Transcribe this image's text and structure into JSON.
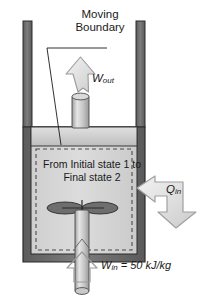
{
  "figure": {
    "type": "thermodynamics-schematic"
  },
  "labels": {
    "moving_boundary": "Moving Boundary",
    "work_out_symbol": "W",
    "work_out_subscript": "out",
    "heat_in_symbol": "Q",
    "heat_in_subscript": "in",
    "work_in_symbol": "W",
    "work_in_subscript": "in",
    "work_in_value": " = 50 kJ/kg",
    "process_state": "From Initial state 1 to Final state 2"
  },
  "colors": {
    "wall_dark": "#6b6b6b",
    "wall_outline": "#2b2b2b",
    "gas_fill": "#d8d8d8",
    "piston_fill": "#cfcfcf",
    "arrow_fill": "#e4e4e4",
    "arrow_stroke": "#8a8a8a",
    "shaft_fill": "#c4c4c4",
    "text": "#1a1a1a",
    "background": "#ffffff"
  }
}
